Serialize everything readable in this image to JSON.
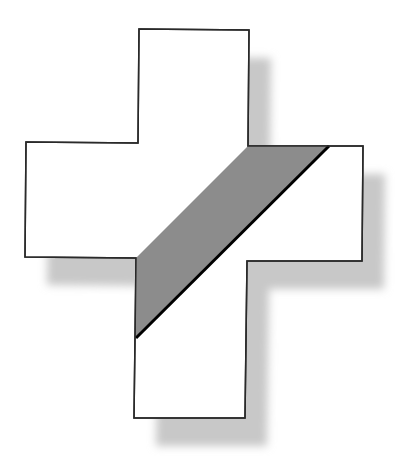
{
  "diagram": {
    "title": "",
    "colors": {
      "background": "#ffffff",
      "cross_fill": "#ffffff",
      "cross_stroke": "#2a2a2a",
      "band_fill": "#8c8c8c",
      "band_edge": "#000000",
      "shadow": "#c8c8c8"
    },
    "shapes": {
      "cross": {
        "points": "139,29 249,30 248,146 363,146 362,261 247,261 245,418 134,418 136,258 25,257 26,142 138,143"
      },
      "band": {
        "points": "248,146 329,146 136,338 136,258"
      },
      "band_edge_line": {
        "x1": 329,
        "y1": 146,
        "x2": 136,
        "y2": 338
      },
      "shadow": {
        "offset_x": 22,
        "offset_y": 28,
        "blur": 4
      }
    }
  }
}
